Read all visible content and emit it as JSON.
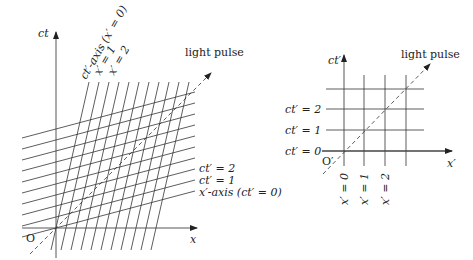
{
  "left_diagram": {
    "axes": {
      "ct_label": "ct",
      "x_label": "x",
      "origin_label": "O"
    },
    "light_pulse_label": "light pulse",
    "primed_axis_labels": {
      "ct_prime_axis": "ct′-axis (x′ = 0)",
      "x_prime_1": "x′ = 1",
      "x_prime_2": "x′ = 2",
      "ct_prime_2": "ct′ = 2",
      "ct_prime_1": "ct′ = 1",
      "x_prime_axis": "x′-axis (ct′ = 0)"
    },
    "grid": {
      "x_prime_lines_count": 11,
      "ct_prime_lines_count": 9,
      "slope_ratio": 0.26
    }
  },
  "right_diagram": {
    "axes": {
      "ct_prime_label": "ct′",
      "x_prime_label": "x′",
      "origin_label": "O′"
    },
    "light_pulse_label": "light pulse",
    "row_labels": [
      "ct′ = 2",
      "ct′ = 1",
      "ct′ = 0"
    ],
    "column_labels": [
      "x′ = 0",
      "x′ = 1",
      "x′ = 2"
    ]
  },
  "colors": {
    "line": "#333333",
    "background": "#ffffff"
  }
}
